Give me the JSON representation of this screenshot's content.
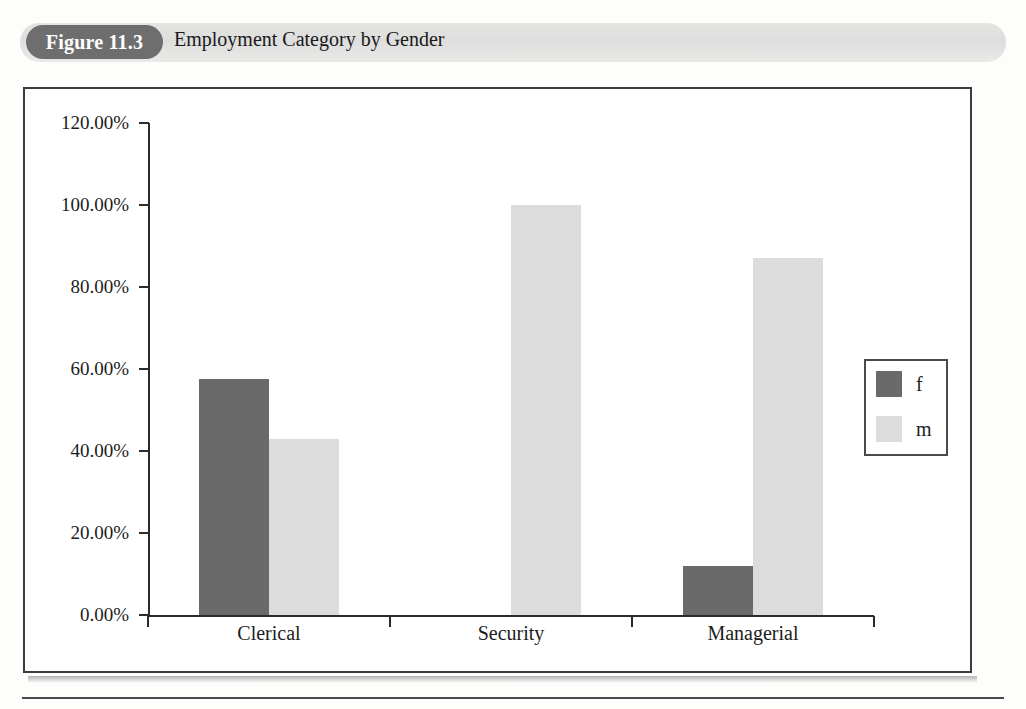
{
  "header": {
    "figure_number": "Figure 11.3",
    "title": "Employment Category by Gender"
  },
  "chart_data": {
    "type": "bar",
    "title": "Employment Category by Gender",
    "xlabel": "",
    "ylabel": "",
    "categories": [
      "Clerical",
      "Security",
      "Managerial"
    ],
    "series": [
      {
        "name": "f",
        "color": "#6a6a6a",
        "values": [
          57.5,
          0.0,
          12.0
        ]
      },
      {
        "name": "m",
        "color": "#dcdcdc",
        "values": [
          43.0,
          100.0,
          87.0
        ]
      }
    ],
    "ylim": [
      0,
      120
    ],
    "ytick_values": [
      0,
      20,
      40,
      60,
      80,
      100,
      120
    ],
    "ytick_labels": [
      "0.00%",
      "20.00%",
      "40.00%",
      "60.00%",
      "80.00%",
      "100.00%",
      "120.00%"
    ],
    "grid": false,
    "legend": {
      "position": "right",
      "entries": [
        "f",
        "m"
      ]
    }
  },
  "colors": {
    "bar_f": "#6a6a6a",
    "bar_m": "#dcdcdc",
    "pill_background": "#6e6e6e",
    "banner_background": "#e2e2e0",
    "axis": "#2b2b2b"
  }
}
